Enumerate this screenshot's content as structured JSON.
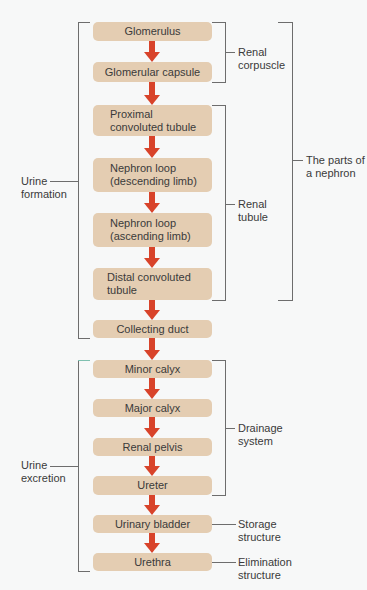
{
  "diagram": {
    "boxes": [
      {
        "id": "glomerulus",
        "label": "Glomerulus"
      },
      {
        "id": "glomerular-capsule",
        "label": "Glomerular capsule"
      },
      {
        "id": "proximal-convoluted-tubule",
        "label": "Proximal\nconvoluted tubule"
      },
      {
        "id": "nephron-loop-descending",
        "label": "Nephron loop\n(descending limb)"
      },
      {
        "id": "nephron-loop-ascending",
        "label": "Nephron loop\n(ascending limb)"
      },
      {
        "id": "distal-convoluted-tubule",
        "label": "Distal convoluted\ntubule"
      },
      {
        "id": "collecting-duct",
        "label": "Collecting duct"
      },
      {
        "id": "minor-calyx",
        "label": "Minor calyx"
      },
      {
        "id": "major-calyx",
        "label": "Major calyx"
      },
      {
        "id": "renal-pelvis",
        "label": "Renal pelvis"
      },
      {
        "id": "ureter",
        "label": "Ureter"
      },
      {
        "id": "urinary-bladder",
        "label": "Urinary bladder"
      },
      {
        "id": "urethra",
        "label": "Urethra"
      }
    ],
    "groups": {
      "renal_corpuscle": "Renal\ncorpuscle",
      "renal_tubule": "Renal\ntubule",
      "parts_of_nephron": "The parts of\na nephron",
      "urine_formation": "Urine\nformation",
      "drainage_system": "Drainage\nsystem",
      "storage_structure": "Storage\nstructure",
      "elimination_structure": "Elimination\nstructure",
      "urine_excretion": "Urine\nexcretion"
    },
    "colors": {
      "box_fill": "#e4cdb2",
      "arrow": "#d8432a",
      "bracket": "#6d6d6d",
      "background": "#f7f8f8"
    }
  }
}
